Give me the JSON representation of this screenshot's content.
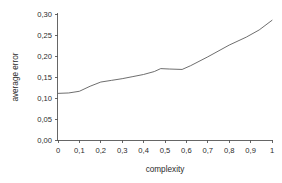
{
  "chart_data": {
    "type": "line",
    "title": "",
    "xlabel": "complexity",
    "ylabel": "average error",
    "xlim": [
      0,
      1
    ],
    "ylim": [
      0,
      0.3
    ],
    "grid": false,
    "legend": false,
    "decimal_separator": ",",
    "x_tick_labels": [
      "0",
      "0,1",
      "0,2",
      "0,3",
      "0,4",
      "0,5",
      "0,6",
      "0,7",
      "0,8",
      "0,9",
      "1"
    ],
    "x_tick_values": [
      0,
      0.1,
      0.2,
      0.3,
      0.4,
      0.5,
      0.6,
      0.7,
      0.8,
      0.9,
      1
    ],
    "y_tick_labels": [
      "0,00",
      "0,05",
      "0,10",
      "0,15",
      "0,20",
      "0,25",
      "0,30"
    ],
    "y_tick_values": [
      0,
      0.05,
      0.1,
      0.15,
      0.2,
      0.25,
      0.3
    ],
    "series": [
      {
        "name": "average error",
        "color": "#5e5e5e",
        "x": [
          0,
          0.05,
          0.1,
          0.15,
          0.2,
          0.25,
          0.3,
          0.35,
          0.4,
          0.45,
          0.48,
          0.52,
          0.58,
          0.62,
          0.7,
          0.8,
          0.88,
          0.94,
          1.0
        ],
        "values": [
          0.111,
          0.112,
          0.116,
          0.128,
          0.138,
          0.142,
          0.146,
          0.151,
          0.156,
          0.163,
          0.17,
          0.169,
          0.168,
          0.177,
          0.198,
          0.226,
          0.245,
          0.262,
          0.285
        ]
      }
    ]
  },
  "axes": {
    "x_axis_name": "complexity-axis",
    "y_axis_name": "average-error-axis"
  }
}
